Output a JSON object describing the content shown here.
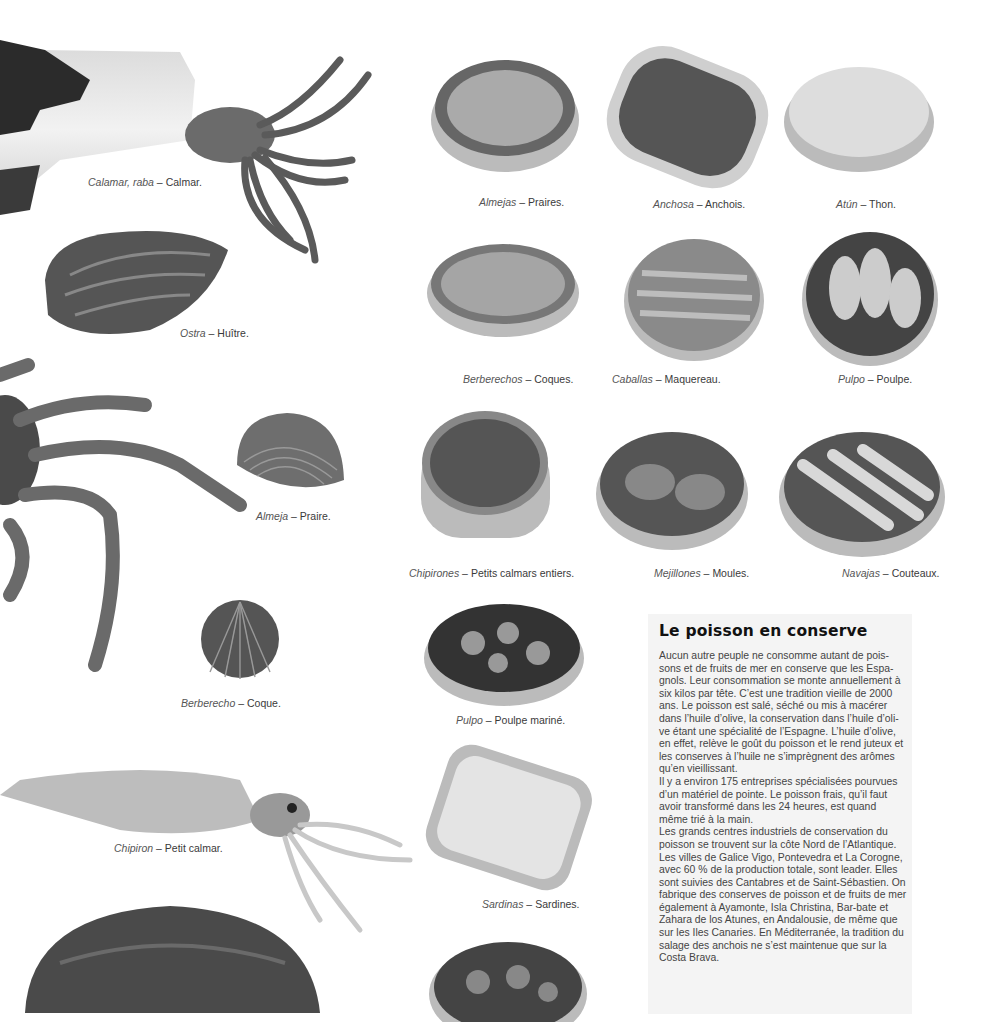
{
  "page": {
    "header_fragment": ""
  },
  "captions": {
    "calamar": {
      "es": "Calamar, raba",
      "fr": "Calmar."
    },
    "ostra": {
      "es": "Ostra",
      "fr": "Huître."
    },
    "almeja": {
      "es": "Almeja",
      "fr": "Praire."
    },
    "berberecho": {
      "es": "Berberecho",
      "fr": "Coque."
    },
    "chipiron": {
      "es": "Chipiron",
      "fr": "Petit calmar."
    },
    "almejas": {
      "es": "Almejas",
      "fr": "Praires."
    },
    "anchosa": {
      "es": "Anchosa",
      "fr": "Anchois."
    },
    "atun": {
      "es": "Atún",
      "fr": "Thon."
    },
    "berberechos": {
      "es": "Berberechos",
      "fr": "Coques."
    },
    "caballas": {
      "es": "Caballas",
      "fr": "Maquereau."
    },
    "pulpo": {
      "es": "Pulpo",
      "fr": "Poulpe."
    },
    "chipirones": {
      "es": "Chipirones",
      "fr": "Petits calmars entiers."
    },
    "mejillones": {
      "es": "Mejillones",
      "fr": "Moules."
    },
    "navajas": {
      "es": "Navajas",
      "fr": "Couteaux."
    },
    "pulpo_marine": {
      "es": "Pulpo",
      "fr": "Poulpe mariné."
    },
    "sardinas": {
      "es": "Sardinas",
      "fr": "Sardines."
    }
  },
  "separator": " – ",
  "infobox": {
    "title": "Le poisson en conserve",
    "body": "Aucun autre peuple ne consomme autant de pois-sons et de fruits de mer en conserve que les Espa-gnols. Leur consommation se monte annuellement à six kilos par tête. C’est une tradition vieille de 2000 ans. Le poisson est salé, séché ou mis à macérer dans l’huile d’olive, la conservation dans l’huile d’oli-ve étant une spécialité de l’Espagne. L’huile d’olive, en effet, relève le goût du poisson et le rend juteux et les conserves à l’huile ne s’imprègnent des arômes qu’en vieillissant.\nIl y a environ 175 entreprises spécialisées pourvues d’un matériel de pointe. Le poisson frais, qu’il faut avoir transformé dans les 24 heures, est quand même trié à la main.\nLes grands centres industriels de conservation du poisson se trouvent sur la côte Nord de l’Atlantique. Les villes de Galice Vigo, Pontevedra et La Corogne, avec 60 % de la production totale, sont leader. Elles sont suivies des Cantabres et de Saint-Sébastien. On fabrique des conserves de poisson et de fruits de mer également à Ayamonte, Isla Christina, Bar-bate et Zahara de los Atunes, en Andalousie, de même que sur les Iles Canaries. En Méditerranée, la tradition du salage des anchois ne s’est maintenue que sur la Costa Brava."
  }
}
